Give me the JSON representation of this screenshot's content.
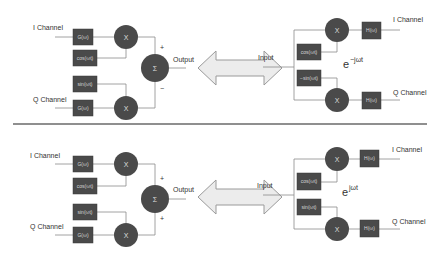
{
  "diagram": {
    "divider": true,
    "panels": [
      {
        "id": "top",
        "transmitter": {
          "inputs": [
            {
              "label": "I Channel",
              "filter": "G(ω)",
              "carrier": "cos(ωt)",
              "multiplier": "X",
              "sign": "+"
            },
            {
              "label": "Q Channel",
              "filter": "G(ω)",
              "carrier": "sin(ωt)",
              "multiplier": "X",
              "sign": "−"
            }
          ],
          "summer": "Σ",
          "output_label": "Output"
        },
        "link": "double-arrow",
        "receiver": {
          "input_label": "Input",
          "exponent_base": "e",
          "exponent_power": "−jωt",
          "outputs": [
            {
              "label": "I Channel",
              "filter": "H(ω)",
              "carrier": "cos(ωt)",
              "multiplier": "X"
            },
            {
              "label": "Q Channel",
              "filter": "H(ω)",
              "carrier": "−sin(ωt)",
              "multiplier": "X"
            }
          ]
        }
      },
      {
        "id": "bottom",
        "transmitter": {
          "inputs": [
            {
              "label": "I Channel",
              "filter": "G(ω)",
              "carrier": "cos(ωt)",
              "multiplier": "X",
              "sign": "+"
            },
            {
              "label": "Q Channel",
              "filter": "G(ω)",
              "carrier": "sin(ωt)",
              "multiplier": "X",
              "sign": "+"
            }
          ],
          "summer": "Σ",
          "output_label": "Output"
        },
        "link": "double-arrow",
        "receiver": {
          "input_label": "Input",
          "exponent_base": "e",
          "exponent_power": "jωt",
          "outputs": [
            {
              "label": "I Channel",
              "filter": "H(ω)",
              "carrier": "cos(ωt)",
              "multiplier": "X"
            },
            {
              "label": "Q Channel",
              "filter": "H(ω)",
              "carrier": "sin(ωt)",
              "multiplier": "X"
            }
          ]
        }
      }
    ],
    "colors": {
      "block_fill": "#4a4a4a",
      "wire": "#8a8a8a",
      "arrow_fill": "#ececec",
      "text": "#333333"
    }
  }
}
